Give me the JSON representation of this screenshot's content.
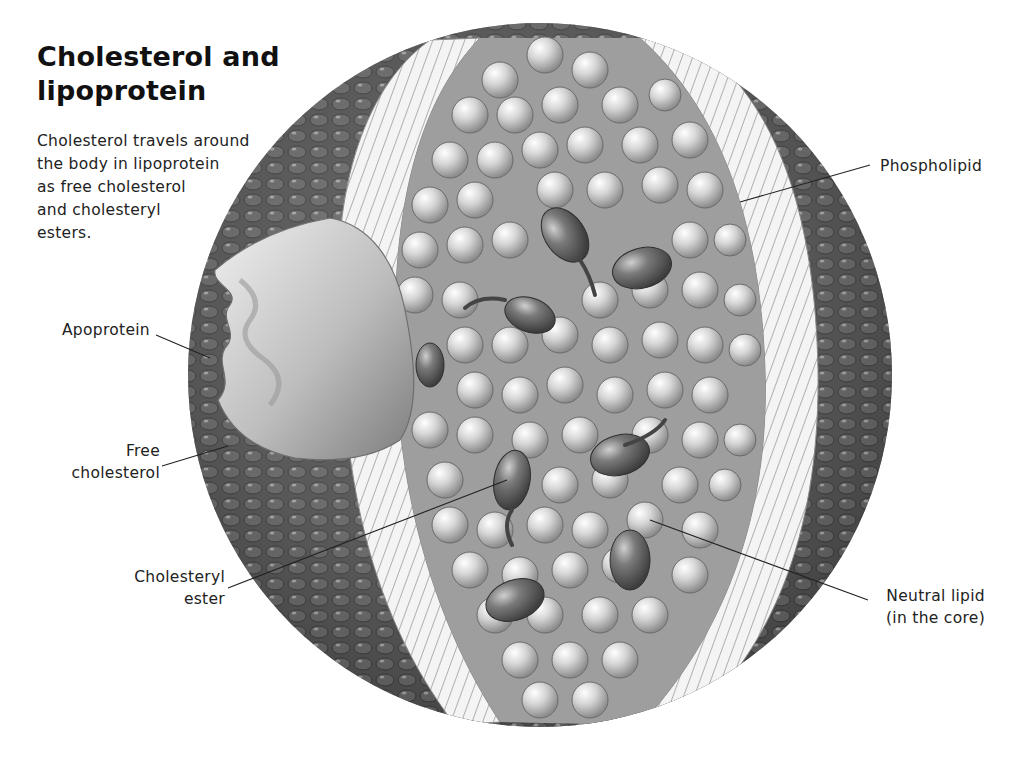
{
  "heading": {
    "title_line1": "Cholesterol and",
    "title_line2": "lipoprotein"
  },
  "intro": {
    "lines": [
      "Cholesterol travels around",
      "the body in lipoprotein",
      "as free cholesterol",
      "and cholesteryl",
      "esters."
    ]
  },
  "labels": {
    "phospholipid": "Phospholipid",
    "apoprotein": "Apoprotein",
    "free_cholesterol": [
      "Free",
      "cholesterol"
    ],
    "cholesteryl_ester": [
      "Cholesteryl",
      "ester"
    ],
    "neutral_lipid": [
      "Neutral lipid",
      "(in the core)"
    ]
  },
  "illustration": {
    "subject": "lipoprotein-particle-cutaway",
    "style": "grayscale",
    "colors": {
      "background": "#ffffff",
      "shell_dark": "#4a4a4a",
      "bilayer_light": "#f2f2f2",
      "lipid_sphere": "#cfcfcf",
      "ester": "#6e6e6e",
      "leader_line": "#222222"
    }
  }
}
